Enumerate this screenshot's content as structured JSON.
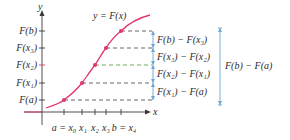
{
  "figure": {
    "curve_label": "y = F(x)",
    "axis": {
      "x_label": "x",
      "y_label": "y"
    },
    "y_ticks": [
      "F(b)",
      "F(x₃)",
      "F(x₂)",
      "F(x₁)",
      "F(a)"
    ],
    "x_ticks": [
      "a = x₀",
      "x₁",
      "x₂",
      "x₃",
      "b = x₄"
    ],
    "differences": [
      "F(b) − F(x₃)",
      "F(x₃) − F(x₂)",
      "F(x₂) − F(x₁)",
      "F(x₁) − F(a)"
    ],
    "total_difference": "F(b) − F(a)",
    "colors": {
      "curve": "#e2366f",
      "axis": "#3a3a3a",
      "dashed_gray": "#555555",
      "dashed_green": "#5aa04a",
      "bracket": "#6aa7d8"
    }
  }
}
